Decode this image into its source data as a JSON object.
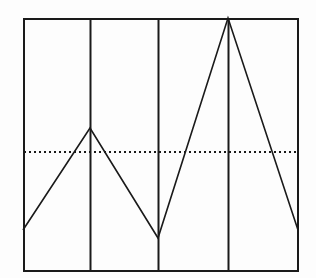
{
  "page": {
    "background_color": "#fdfdfd",
    "top_clipped_text_artifact": "                        "
  },
  "chart_data": {
    "type": "line",
    "title": "",
    "subtitle": "",
    "xlabel": "",
    "ylabel": "",
    "xlim": [
      0,
      4
    ],
    "ylim": [
      0,
      100
    ],
    "grid": false,
    "legend_position": "none",
    "x": [
      0,
      1,
      2,
      3,
      4
    ],
    "values": [
      16,
      56,
      13,
      100,
      16
    ],
    "series": [
      {
        "name": "data",
        "values": [
          16,
          56,
          13,
          100,
          16
        ],
        "color": "#1a1a1a",
        "line_width": 1.6,
        "style": "solid"
      }
    ],
    "categories": [
      "0",
      "1",
      "2",
      "3",
      "4"
    ],
    "tick_labels": {
      "x": [
        "",
        "",
        "",
        "",
        ""
      ],
      "y": []
    },
    "annotations": [
      {
        "name": "reference-line",
        "type": "horizontal-dotted-line",
        "value": 62,
        "color": "#1a1a1a",
        "style": "dotted",
        "label": ""
      }
    ],
    "vertical_dividers": {
      "name": "panel-separators",
      "x": [
        1,
        2,
        3
      ],
      "color": "#1a1a1a",
      "style": "solid",
      "count": 3
    },
    "frame": {
      "visible": true,
      "color": "#1a1a1a",
      "line_width": 2
    },
    "pixel_geometry": {
      "frame": {
        "left": 23,
        "top": 18,
        "right": 298,
        "bottom": 271
      },
      "divider_x": [
        90,
        158,
        228
      ],
      "reference_line_y": 151,
      "polyline": [
        [
          23,
          230
        ],
        [
          90,
          128
        ],
        [
          158,
          238
        ],
        [
          228,
          18
        ],
        [
          298,
          230
        ]
      ]
    }
  }
}
